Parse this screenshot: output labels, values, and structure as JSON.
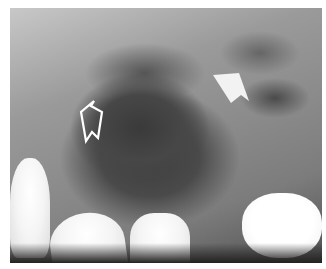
{
  "image": {
    "description": "Dental radiograph (X-ray) of maxillary sinus region with two annotation arrows",
    "annotations": [
      {
        "type": "outline-arrow",
        "color": "#ffffff",
        "direction": "up-right",
        "position": [
          90,
          110
        ]
      },
      {
        "type": "solid-arrow",
        "color": "#f2f2f2",
        "direction": "down-right",
        "position": [
          228,
          85
        ]
      }
    ],
    "colors": {
      "background": "#ffffff",
      "bone": "#9a9a9a",
      "sinus_dark": "#3d3d3d",
      "tooth": "#f4f4f4"
    }
  }
}
